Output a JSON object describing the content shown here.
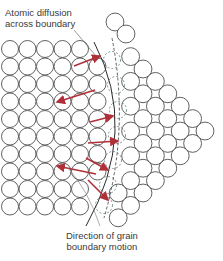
{
  "figure": {
    "labels": {
      "diffusion_line1": "Atomic diffusion",
      "diffusion_line2": "across boundary",
      "motion_line1": "Direction of grain",
      "motion_line2": "boundary motion"
    },
    "colors": {
      "atom_stroke": "#3a3a3a",
      "arrow": "#b0303a",
      "leader_line": "#555555",
      "boundary": "#2a2a2a"
    },
    "left_grain": {
      "lattice": "square",
      "atom_diameter": 17,
      "columns": 6,
      "rows": 10
    },
    "right_grain": {
      "lattice": "square rotated 45°",
      "atom_diameter": 17,
      "shape": "triangle pointing right"
    },
    "arrows": [
      {
        "from": [
          74,
          66
        ],
        "to": [
          100,
          56
        ]
      },
      {
        "from": [
          95,
          90
        ],
        "to": [
          57,
          102
        ]
      },
      {
        "from": [
          90,
          122
        ],
        "to": [
          113,
          116
        ]
      },
      {
        "from": [
          88,
          143
        ],
        "to": [
          118,
          141
        ]
      },
      {
        "from": [
          86,
          158
        ],
        "to": [
          108,
          170
        ]
      },
      {
        "from": [
          96,
          174
        ],
        "to": [
          57,
          166
        ]
      },
      {
        "from": [
          88,
          180
        ],
        "to": [
          108,
          200
        ]
      }
    ]
  }
}
